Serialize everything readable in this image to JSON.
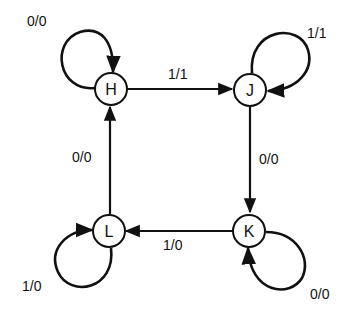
{
  "diagram": {
    "type": "state-transition",
    "nodes": [
      {
        "id": "H",
        "label": "H"
      },
      {
        "id": "J",
        "label": "J"
      },
      {
        "id": "K",
        "label": "K"
      },
      {
        "id": "L",
        "label": "L"
      }
    ],
    "edges": [
      {
        "from": "H",
        "to": "H",
        "label": "0/0"
      },
      {
        "from": "H",
        "to": "J",
        "label": "1/1"
      },
      {
        "from": "J",
        "to": "J",
        "label": "1/1"
      },
      {
        "from": "J",
        "to": "K",
        "label": "0/0"
      },
      {
        "from": "K",
        "to": "K",
        "label": "0/0"
      },
      {
        "from": "K",
        "to": "L",
        "label": "1/0"
      },
      {
        "from": "L",
        "to": "L",
        "label": "1/0"
      },
      {
        "from": "L",
        "to": "H",
        "label": "0/0"
      }
    ],
    "colors": {
      "stroke": "#111111",
      "background": "#ffffff"
    }
  }
}
